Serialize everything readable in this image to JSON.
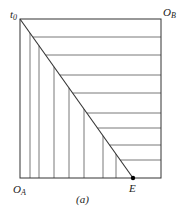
{
  "diagram": {
    "type": "edgeworth-box",
    "caption": "(a)",
    "labels": {
      "top_left": "t",
      "top_left_sub": "0",
      "top_right": "O",
      "top_right_sub": "B",
      "bottom_left": "O",
      "bottom_left_sub": "A",
      "point": "E"
    },
    "box": {
      "left": 20,
      "top": 19,
      "right": 161,
      "bottom": 178
    },
    "diagonal": {
      "x1": 20,
      "y1": 19,
      "x2": 133,
      "y2": 178
    },
    "vertical_lines_x": [
      30,
      39,
      54,
      69,
      84,
      103,
      116
    ],
    "horizontal_lines_y": [
      37,
      55,
      75,
      93,
      113,
      128,
      145,
      160
    ],
    "colors": {
      "line": "#333333",
      "point": "#000000"
    }
  }
}
